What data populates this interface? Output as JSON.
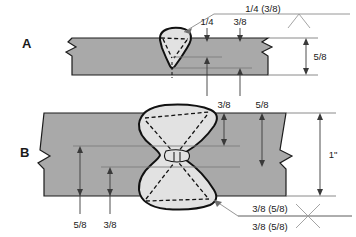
{
  "figure": {
    "background_color": "#ffffff",
    "plate_color": "#a9a9a9",
    "weld_color": "#e2e2e2",
    "outline_color": "#111111"
  },
  "panels": [
    {
      "key": "A",
      "letter": "A",
      "plate_thickness_label": "5/8",
      "weld_type": "single-V-groove",
      "dimension_labels": [
        {
          "name": "groove-weld-size",
          "text": "1/4"
        },
        {
          "name": "depth-of-preparation",
          "text": "3/8"
        },
        {
          "name": "plate-thickness",
          "text": "5/8"
        }
      ],
      "welding_symbol": {
        "name": "single-vee-weld-symbol",
        "text": "1/4 (3/8)",
        "symbol_glyph": "V",
        "symbol_description": "vee groove symbol below reference line"
      }
    },
    {
      "key": "B",
      "letter": "B",
      "plate_thickness_label": "1\"",
      "weld_type": "double-V-groove",
      "dimension_labels": [
        {
          "name": "upper-depth-of-preparation",
          "text": "3/8"
        },
        {
          "name": "upper-groove-weld-size",
          "text": "5/8"
        },
        {
          "name": "lower-groove-weld-size",
          "text": "5/8"
        },
        {
          "name": "lower-depth-of-preparation",
          "text": "3/8"
        },
        {
          "name": "plate-thickness",
          "text": "1\""
        }
      ],
      "welding_symbol": {
        "name": "double-vee-weld-symbol",
        "text_above": "3/8 (5/8)",
        "text_below": "3/8 (5/8)",
        "symbol_glyph": "X",
        "symbol_description": "double vee groove symbol on reference line"
      }
    }
  ]
}
